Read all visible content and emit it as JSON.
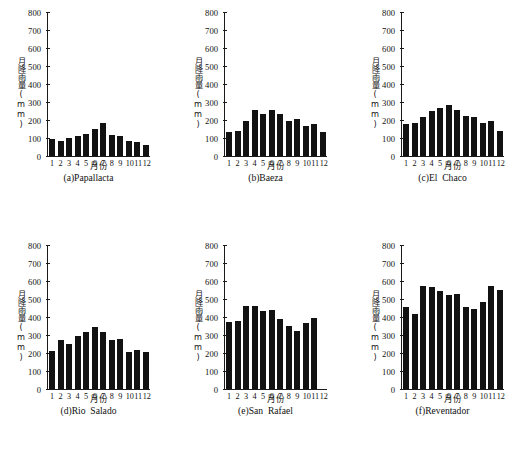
{
  "figure": {
    "axis_titles": {
      "y": "月降雨量(mm)",
      "x": "月份"
    },
    "y_ticks": [
      "800",
      "700",
      "600",
      "500",
      "400",
      "300",
      "200",
      "100",
      "0"
    ],
    "x_ticks": [
      "1",
      "2",
      "3",
      "4",
      "5",
      "6",
      "7",
      "8",
      "9",
      "10",
      "11",
      "12"
    ],
    "bar_color": "#121212",
    "axis_color": "#1a1a1a",
    "background": "#ffffff"
  },
  "chart_data": [
    {
      "type": "bar",
      "panel": "a",
      "title": "(a)Papallacta",
      "categories": [
        "1",
        "2",
        "3",
        "4",
        "5",
        "6",
        "7",
        "8",
        "9",
        "10",
        "11",
        "12"
      ],
      "values": [
        93,
        85,
        100,
        113,
        125,
        152,
        184,
        117,
        111,
        86,
        76,
        60
      ],
      "xlabel": "月份",
      "ylabel": "月降雨量(mm)",
      "ylim": [
        0,
        800
      ],
      "grid": false,
      "legend": "none"
    },
    {
      "type": "bar",
      "panel": "b",
      "title": "(b)Baeza",
      "categories": [
        "1",
        "2",
        "3",
        "4",
        "5",
        "6",
        "7",
        "8",
        "9",
        "10",
        "11",
        "12"
      ],
      "values": [
        131,
        141,
        193,
        258,
        233,
        254,
        231,
        193,
        204,
        167,
        178,
        133
      ],
      "xlabel": "月份",
      "ylabel": "月降雨量(mm)",
      "ylim": [
        0,
        800
      ],
      "grid": false,
      "legend": "none"
    },
    {
      "type": "bar",
      "panel": "c",
      "title": "(c)El  Chaco",
      "categories": [
        "1",
        "2",
        "3",
        "4",
        "5",
        "6",
        "7",
        "8",
        "9",
        "10",
        "11",
        "12"
      ],
      "values": [
        180,
        186,
        216,
        251,
        268,
        286,
        253,
        220,
        215,
        181,
        193,
        137
      ],
      "xlabel": "月份",
      "ylabel": "月降雨量(mm)",
      "ylim": [
        0,
        800
      ],
      "grid": false,
      "legend": "none"
    },
    {
      "type": "bar",
      "panel": "d",
      "title": "(d)Rio  Salado",
      "categories": [
        "1",
        "2",
        "3",
        "4",
        "5",
        "6",
        "7",
        "8",
        "9",
        "10",
        "11",
        "12"
      ],
      "values": [
        211,
        270,
        250,
        293,
        318,
        347,
        316,
        271,
        279,
        208,
        217,
        205
      ],
      "xlabel": "月份",
      "ylabel": "月降雨量(mm)",
      "ylim": [
        0,
        800
      ],
      "grid": false,
      "legend": "none"
    },
    {
      "type": "bar",
      "panel": "e",
      "title": "(e)San  Rafael",
      "categories": [
        "1",
        "2",
        "3",
        "4",
        "5",
        "6",
        "7",
        "8",
        "9",
        "10",
        "11",
        "12"
      ],
      "values": [
        370,
        379,
        461,
        461,
        432,
        437,
        391,
        349,
        322,
        366,
        396,
        null
      ],
      "xlabel": "月份",
      "ylabel": "月降雨量(mm)",
      "ylim": [
        0,
        800
      ],
      "grid": false,
      "legend": "none"
    },
    {
      "type": "bar",
      "panel": "f",
      "title": "(f)Reventador",
      "categories": [
        "1",
        "2",
        "3",
        "4",
        "5",
        "6",
        "7",
        "8",
        "9",
        "10",
        "11",
        "12"
      ],
      "values": [
        456,
        415,
        574,
        568,
        543,
        521,
        528,
        457,
        442,
        481,
        574,
        550
      ],
      "xlabel": "月份",
      "ylabel": "月降雨量(mm)",
      "ylim": [
        0,
        800
      ],
      "grid": false,
      "legend": "none"
    }
  ]
}
